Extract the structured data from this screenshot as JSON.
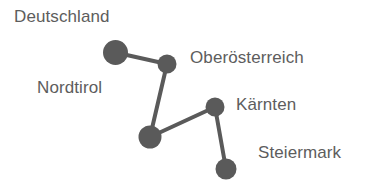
{
  "diagram": {
    "type": "node-link-graph",
    "background_color": "#ffffff",
    "node_color": "#5a5a5a",
    "edge_color": "#5a5a5a",
    "label_color": "#5d5d5d",
    "width": 379,
    "height": 192,
    "nodes": [
      {
        "id": "deutschland",
        "label": "Deutschland",
        "cx": 115.5,
        "cy": 52.5,
        "r": 12.5,
        "label_x": 14,
        "label_y": 8
      },
      {
        "id": "oberoesterreich",
        "label": "Oberösterreich",
        "cx": 167,
        "cy": 64,
        "r": 9.5,
        "label_x": 190,
        "label_y": 49
      },
      {
        "id": "nordtirol",
        "label": "Nordtirol",
        "cx": 150,
        "cy": 137,
        "r": 11.5,
        "label_x": 37,
        "label_y": 79
      },
      {
        "id": "kaernten",
        "label": "Kärnten",
        "cx": 215,
        "cy": 107,
        "r": 9.5,
        "label_x": 236,
        "label_y": 96
      },
      {
        "id": "steiermark",
        "label": "Steiermark",
        "cx": 226,
        "cy": 169,
        "r": 10.5,
        "label_x": 258,
        "label_y": 144
      }
    ],
    "edges": [
      {
        "id": "edge-deutschland-oberoesterreich",
        "source": "deutschland",
        "target": "oberoesterreich",
        "width": 4
      },
      {
        "id": "edge-oberoesterreich-nordtirol",
        "source": "oberoesterreich",
        "target": "nordtirol",
        "width": 4
      },
      {
        "id": "edge-nordtirol-kaernten",
        "source": "nordtirol",
        "target": "kaernten",
        "width": 4
      },
      {
        "id": "edge-kaernten-steiermark",
        "source": "kaernten",
        "target": "steiermark",
        "width": 4
      }
    ]
  }
}
